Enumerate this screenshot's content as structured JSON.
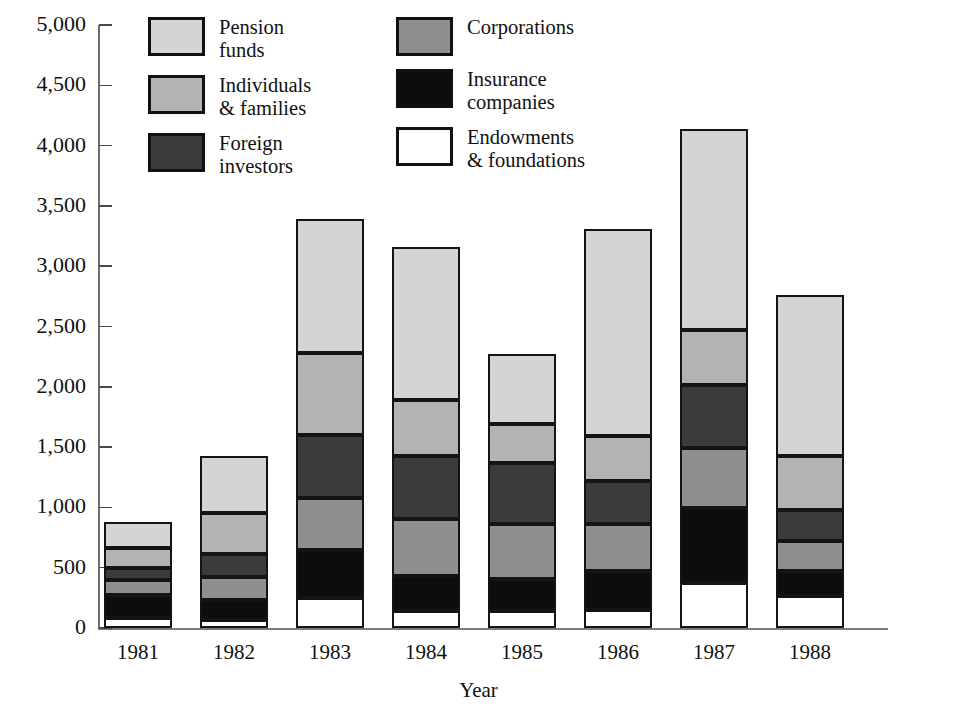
{
  "legend": {
    "left_column": [
      {
        "name": "pension-funds",
        "label": "Pension\nfunds",
        "color": "#d4d4d4"
      },
      {
        "name": "individuals-families",
        "label": "Individuals\n& families",
        "color": "#b3b3b3"
      },
      {
        "name": "foreign-investors",
        "label": "Foreign\ninvestors",
        "color": "#3b3b3b"
      }
    ],
    "right_column": [
      {
        "name": "corporations",
        "label": "Corporations",
        "color": "#8f8f8f"
      },
      {
        "name": "insurance-companies",
        "label": "Insurance\ncompanies",
        "color": "#0d0d0d"
      },
      {
        "name": "endowments-foundations",
        "label": "Endowments\n& foundations",
        "color": "#ffffff"
      }
    ]
  },
  "axes": {
    "y_ticks": [
      "5,000",
      "4,500",
      "4,000",
      "3,500",
      "3,000",
      "2,500",
      "2,000",
      "1,500",
      "1,000",
      "500",
      "0"
    ],
    "y_tick_values": [
      5000,
      4500,
      4000,
      3500,
      3000,
      2500,
      2000,
      1500,
      1000,
      500,
      0
    ],
    "x_title": "Year",
    "x_ticks": [
      "1981",
      "1982",
      "1983",
      "1984",
      "1985",
      "1986",
      "1987",
      "1988"
    ]
  },
  "chart_data": {
    "type": "bar",
    "subtype": "stacked",
    "title": "",
    "xlabel": "Year",
    "ylabel": "",
    "ylim": [
      0,
      5000
    ],
    "ytick_step": 500,
    "grid": false,
    "legend_position": "top",
    "categories": [
      "1981",
      "1982",
      "1983",
      "1984",
      "1985",
      "1986",
      "1987",
      "1988"
    ],
    "stack_order_bottom_to_top": [
      "Endowments & foundations",
      "Insurance companies",
      "Corporations",
      "Foreign investors",
      "Individuals & families",
      "Pension funds"
    ],
    "series": [
      {
        "name": "Endowments & foundations",
        "color": "#ffffff",
        "values": [
          85,
          70,
          250,
          145,
          145,
          150,
          375,
          265
        ]
      },
      {
        "name": "Insurance companies",
        "color": "#0d0d0d",
        "values": [
          190,
          165,
          400,
          290,
          265,
          325,
          620,
          210
        ]
      },
      {
        "name": "Corporations",
        "color": "#8f8f8f",
        "values": [
          125,
          185,
          430,
          470,
          455,
          390,
          500,
          250
        ]
      },
      {
        "name": "Foreign investors",
        "color": "#3b3b3b",
        "values": [
          100,
          190,
          520,
          525,
          500,
          350,
          520,
          250
        ]
      },
      {
        "name": "Individuals & families",
        "color": "#b3b3b3",
        "values": [
          165,
          340,
          680,
          460,
          330,
          380,
          455,
          455
        ]
      },
      {
        "name": "Pension funds",
        "color": "#d4d4d4",
        "values": [
          215,
          480,
          1110,
          1270,
          580,
          1710,
          1670,
          1330
        ]
      }
    ],
    "totals": [
      880,
      1430,
      3390,
      3160,
      2275,
      3305,
      4140,
      2760
    ]
  }
}
